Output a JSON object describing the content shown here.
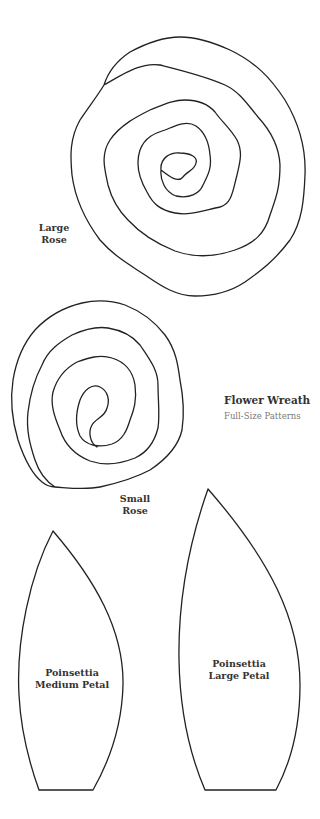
{
  "document": {
    "title": "Flower Wreath",
    "subtitle": "Full-Size Patterns"
  },
  "patterns": {
    "large_rose": {
      "label_line1": "Large",
      "label_line2": "Rose",
      "path": "M 161 170 C 160 158 170 152 180 153 C 190 153 198 157 196 163 C 195 170 186 172 183 177 C 178 183 170 177 161 170 C 160 180 165 192 176 196 C 190 199 200 193 203 185 C 208 175 212 168 210 155 C 209 143 206 133 196 126 C 186 120 175 126 165 130 C 155 133 145 137 140 150 C 135 165 140 180 147 192 C 153 204 160 210 175 213 C 190 216 205 210 220 207 C 232 204 233 190 237 175 C 240 162 243 152 237 140 C 230 128 222 122 215 112 C 208 104 198 100 185 100 C 173 100 163 105 150 110 C 138 116 120 125 110 140 C 100 155 105 170 108 185 C 112 200 118 210 128 220 C 140 233 155 243 175 251 C 195 258 215 257 235 250 C 255 243 265 233 270 215 C 275 200 280 190 280 165 C 279 145 270 130 258 117 C 248 105 240 92 225 85 C 205 76 180 70 160 65 C 140 62 122 75 104 85 C 98 95 88 108 80 120 C 70 138 70 155 72 175 C 75 198 85 220 100 240 C 115 257 130 265 145 275 C 160 285 175 296 195 296 C 215 296 230 292 245 282 C 262 270 275 260 290 240 C 302 222 304 200 305 175 C 306 150 300 125 285 100 C 270 77 255 62 230 50 C 210 41 195 37 180 37 C 162 37 145 44 130 52 C 118 60 108 72 104 85"
    },
    "small_rose": {
      "label_line1": "Small",
      "label_line2": "Rose",
      "path": "M 97 447 C 90 443 88 432 92 425 C 96 418 105 417 107 408 C 110 400 108 391 100 387 C 92 383 84 390 80 400 C 76 412 75 425 80 436 C 86 446 100 448 112 444 C 123 440 127 430 130 420 C 134 410 137 400 135 385 C 133 372 125 362 112 358 C 100 354 88 358 77 362 C 66 368 57 378 53 392 C 50 405 55 418 60 430 C 65 445 75 455 90 461 C 105 466 120 464 135 458 C 148 452 155 440 158 428 C 160 415 158 400 158 385 C 158 370 150 360 140 345 C 132 335 120 330 108 328 C 95 326 83 330 72 335 C 60 342 48 350 42 365 C 34 380 30 395 28 412 C 26 430 30 445 35 460 C 40 475 47 482 55 487 C 70 488 85 490 100 487 C 118 483 135 478 150 470 C 165 460 178 448 182 430 C 185 410 183 395 180 380 C 178 365 176 350 165 335 C 155 322 143 312 125 305 C 110 300 95 300 82 303 C 65 307 48 316 35 330 C 22 345 16 362 13 380 C 10 400 12 420 18 440 C 24 458 32 474 42 482 C 47 486 52 487 55 487"
    },
    "medium_petal": {
      "label_line1": "Poinsettia",
      "label_line2": "Medium Petal",
      "path": "M 53 531 C 30 575 16 640 19 695 C 21 735 30 765 39 790 L 93 790 C 110 760 122 725 123 685 C 124 630 95 580 53 531 Z"
    },
    "large_petal": {
      "label_line1": "Poinsettia",
      "label_line2": "Large Petal",
      "path": "M 208 489 C 190 540 178 600 179 660 C 180 715 190 755 205 790 L 276 790 C 292 760 300 725 300 685 C 300 620 270 560 208 489 Z"
    }
  },
  "colors": {
    "stroke": "#222222",
    "label_text": "#333333",
    "subtitle_text": "#7a7a7a",
    "background": "#ffffff"
  }
}
